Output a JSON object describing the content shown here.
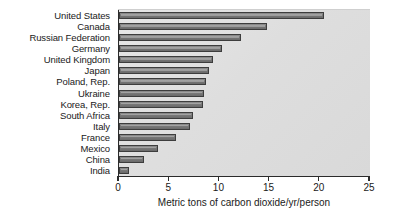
{
  "chart_data": {
    "type": "bar",
    "orientation": "horizontal",
    "title": "",
    "xlabel": "Metric tons of carbon dioxide/yr/person",
    "ylabel": "",
    "xlim": [
      0,
      25
    ],
    "xticks": [
      "0",
      "5",
      "10",
      "15",
      "20",
      "25"
    ],
    "grid": false,
    "legend": null,
    "categories": [
      "United States",
      "Canada",
      "Russian Federation",
      "Germany",
      "United Kingdom",
      "Japan",
      "Poland, Rep.",
      "Ukraine",
      "Korea, Rep.",
      "South Africa",
      "Italy",
      "France",
      "Mexico",
      "China",
      "India"
    ],
    "values": [
      20.4,
      14.7,
      12.2,
      10.3,
      9.4,
      9.0,
      8.7,
      8.5,
      8.4,
      7.4,
      7.1,
      5.7,
      3.9,
      2.5,
      1.0
    ],
    "colors": {
      "bar_fill": "#7b7b7b",
      "bar_edge": "#3d3d3d",
      "plot_background": "#dedede",
      "figure_background": "#ffffff",
      "axis": "#2b2b2b",
      "text": "#1a1a1a"
    }
  }
}
